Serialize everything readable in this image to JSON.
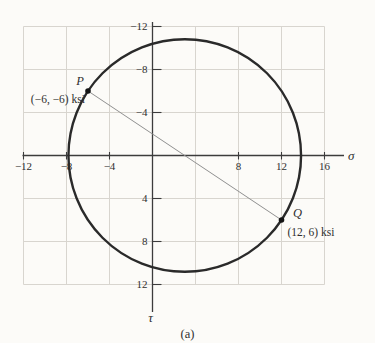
{
  "figure": {
    "caption": "(a)"
  },
  "chart_data": {
    "type": "scatter",
    "title": "",
    "xlabel": "σ",
    "ylabel": "τ",
    "xlim": [
      -12,
      16
    ],
    "ylim": [
      -12,
      12
    ],
    "y_axis_direction": "down",
    "grid": true,
    "grid_step": 4,
    "x_ticks": [
      -12,
      -8,
      -4,
      8,
      12,
      16
    ],
    "y_ticks": [
      -12,
      -8,
      -4,
      4,
      8,
      12
    ],
    "points": [
      {
        "label": "P",
        "x": -6,
        "y": -6,
        "annotation": "(−6, −6) ksi"
      },
      {
        "label": "Q",
        "x": 12,
        "y": 6,
        "annotation": "(12, 6) ksi"
      }
    ],
    "circle": {
      "center": [
        3,
        0
      ],
      "radius": 10.82
    },
    "line_segment": {
      "from": "P",
      "to": "Q"
    },
    "caption": "(a)",
    "colors": {
      "grid": "#d8d5cf",
      "axis": "#3c3c3c",
      "circle": "#2a2a2a",
      "diameter_line": "#909090",
      "point": "#141414",
      "text": "#2f2f2f",
      "background": "#fcfbf8"
    }
  }
}
